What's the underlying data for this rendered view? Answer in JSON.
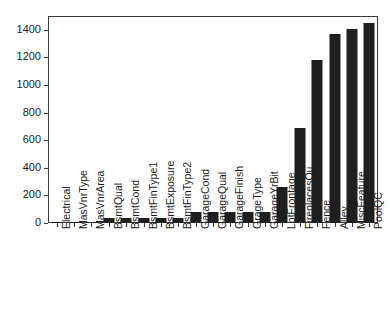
{
  "chart_data": {
    "type": "bar",
    "title": "",
    "subtitle": "",
    "xlabel": "",
    "ylabel": "",
    "ylim": [
      0,
      1500
    ],
    "grid": false,
    "legend": null,
    "y_ticks": [
      0,
      200,
      400,
      600,
      800,
      1000,
      1200,
      1400
    ],
    "y_tick_labels": [
      "0",
      "200",
      "400",
      "600",
      "800",
      "1000",
      "1200",
      "1400"
    ],
    "bar_color": "#1f1f1f",
    "axis_color": "#3a3a3a",
    "categories": [
      "Electrical",
      "MasVnrType",
      "MasVnrArea",
      "BsmtQual",
      "BsmtCond",
      "BsmtFinType1",
      "BsmtExposure",
      "BsmtFinType2",
      "GarageCond",
      "GarageQual",
      "GarageFinish",
      "GrageType",
      "GarageYrBit",
      "LotFrontage",
      "FireplacesQu",
      "Fence",
      "Alley",
      "MiscFeature",
      "PoolQC"
    ],
    "values": [
      1,
      8,
      8,
      37,
      37,
      37,
      38,
      38,
      81,
      81,
      81,
      81,
      81,
      259,
      690,
      1179,
      1369,
      1406,
      1453
    ]
  }
}
